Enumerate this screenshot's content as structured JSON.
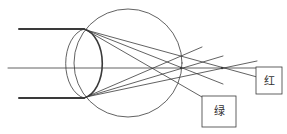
{
  "diagram": {
    "colors": {
      "stroke": "#3a3a3a",
      "background": "#ffffff"
    },
    "labels": {
      "green": "绿",
      "red": "红"
    },
    "eyeball": {
      "cx": 128,
      "cy": 63,
      "r": 54
    },
    "lens": {
      "cx": 83,
      "cy": 63.5,
      "rx": 22,
      "ry": 35
    },
    "optical_axis": {
      "x1": 8,
      "y1": 68,
      "x2": 256,
      "y2": 68
    },
    "incoming_beams": [
      {
        "x1": 19,
        "y1": 29,
        "x2": 84,
        "y2": 29
      },
      {
        "x1": 19,
        "y1": 98,
        "x2": 84,
        "y2": 98
      }
    ],
    "rays": [
      {
        "x1": 86,
        "y1": 30,
        "x2": 202,
        "y2": 97
      },
      {
        "x1": 86,
        "y1": 30,
        "x2": 223,
        "y2": 84
      },
      {
        "x1": 86,
        "y1": 30,
        "x2": 257,
        "y2": 77
      },
      {
        "x1": 86,
        "y1": 97,
        "x2": 202,
        "y2": 47
      },
      {
        "x1": 86,
        "y1": 97,
        "x2": 223,
        "y2": 56
      },
      {
        "x1": 86,
        "y1": 97,
        "x2": 257,
        "y2": 61
      }
    ],
    "boxes": {
      "green": {
        "x": 202,
        "y": 96,
        "w": 34,
        "h": 31
      },
      "red": {
        "x": 256,
        "y": 67,
        "w": 26,
        "h": 27
      }
    }
  }
}
